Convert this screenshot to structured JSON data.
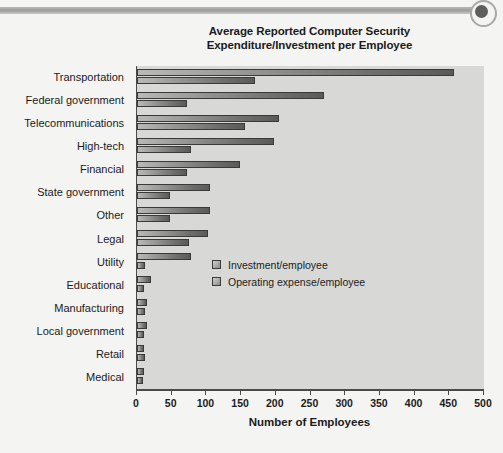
{
  "header": {
    "rule_name": "decorative-rule",
    "dot_name": "decorative-dot"
  },
  "chart_data": {
    "type": "bar",
    "orientation": "horizontal",
    "title": "Average Reported Computer Security Expenditure/Investment per Employee",
    "title_lines": [
      "Average Reported Computer Security",
      "Expenditure/Investment per Employee"
    ],
    "xlabel": "Number of Employees",
    "ylabel": "",
    "xlim": [
      0,
      500
    ],
    "xticks": [
      0,
      50,
      100,
      150,
      200,
      250,
      300,
      350,
      400,
      450,
      500
    ],
    "xtick_labels": [
      "0",
      "50",
      "100",
      "150",
      "200",
      "250",
      "300",
      "350",
      "400",
      "450",
      "500"
    ],
    "grid": false,
    "legend_position": "center-right-inside",
    "categories": [
      "Transportation",
      "Federal government",
      "Telecommunications",
      "High-tech",
      "Financial",
      "State government",
      "Other",
      "Legal",
      "Utility",
      "Educational",
      "Manufacturing",
      "Local government",
      "Retail",
      "Medical"
    ],
    "series": [
      {
        "name": "Investment/employee",
        "values": [
          457,
          270,
          205,
          197,
          148,
          105,
          105,
          103,
          78,
          20,
          15,
          14,
          10,
          10
        ]
      },
      {
        "name": "Operating expense/employee",
        "values": [
          170,
          72,
          155,
          78,
          72,
          48,
          48,
          75,
          12,
          10,
          12,
          10,
          12,
          8
        ]
      }
    ],
    "bar_color": "#6e6e6c",
    "plot_background": "#d8d8d6",
    "axis_color": "#4a4a48",
    "text_color": "#1b1b1b"
  }
}
